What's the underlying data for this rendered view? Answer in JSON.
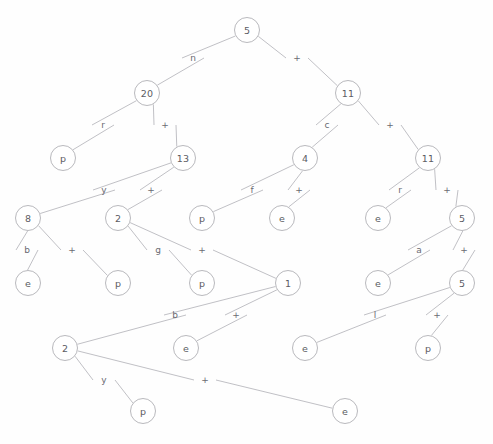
{
  "diagram": {
    "node_stroke": "#b9b9bd",
    "edge_stroke": "#b0b0b6",
    "text_color": "#5c5c63",
    "background": "#fefefe",
    "nodes": [
      {
        "id": "n0",
        "label": "5",
        "x": 247,
        "y": 30
      },
      {
        "id": "n1",
        "label": "20",
        "x": 147,
        "y": 93
      },
      {
        "id": "n2",
        "label": "11",
        "x": 348,
        "y": 93
      },
      {
        "id": "n3",
        "label": "p",
        "x": 63,
        "y": 158
      },
      {
        "id": "n4",
        "label": "13",
        "x": 183,
        "y": 158
      },
      {
        "id": "n5",
        "label": "4",
        "x": 305,
        "y": 158
      },
      {
        "id": "n6",
        "label": "11",
        "x": 428,
        "y": 158
      },
      {
        "id": "n7",
        "label": "8",
        "x": 28,
        "y": 218
      },
      {
        "id": "n8",
        "label": "2",
        "x": 118,
        "y": 218
      },
      {
        "id": "n9",
        "label": "p",
        "x": 202,
        "y": 218
      },
      {
        "id": "n10",
        "label": "e",
        "x": 282,
        "y": 218
      },
      {
        "id": "n11",
        "label": "e",
        "x": 378,
        "y": 218
      },
      {
        "id": "n12",
        "label": "5",
        "x": 462,
        "y": 218
      },
      {
        "id": "n13",
        "label": "e",
        "x": 28,
        "y": 283
      },
      {
        "id": "n14",
        "label": "p",
        "x": 118,
        "y": 283
      },
      {
        "id": "n15",
        "label": "p",
        "x": 202,
        "y": 283
      },
      {
        "id": "n16",
        "label": "1",
        "x": 288,
        "y": 283
      },
      {
        "id": "n17",
        "label": "e",
        "x": 378,
        "y": 283
      },
      {
        "id": "n18",
        "label": "5",
        "x": 462,
        "y": 283
      },
      {
        "id": "n19",
        "label": "2",
        "x": 65,
        "y": 348
      },
      {
        "id": "n20",
        "label": "e",
        "x": 186,
        "y": 348
      },
      {
        "id": "n21",
        "label": "e",
        "x": 305,
        "y": 348
      },
      {
        "id": "n22",
        "label": "p",
        "x": 428,
        "y": 348
      },
      {
        "id": "n23",
        "label": "p",
        "x": 143,
        "y": 411
      },
      {
        "id": "n24",
        "label": "e",
        "x": 345,
        "y": 411
      }
    ],
    "edges": [
      {
        "from": "n0",
        "to": "n1",
        "label": "n",
        "lx": 193,
        "ly": 58
      },
      {
        "from": "n0",
        "to": "n2",
        "label": "+",
        "lx": 297,
        "ly": 58
      },
      {
        "from": "n1",
        "to": "n3",
        "label": "r",
        "lx": 103,
        "ly": 125
      },
      {
        "from": "n1",
        "to": "n4",
        "label": "+",
        "lx": 165,
        "ly": 125
      },
      {
        "from": "n2",
        "to": "n5",
        "label": "c",
        "lx": 327,
        "ly": 125
      },
      {
        "from": "n2",
        "to": "n6",
        "label": "+",
        "lx": 390,
        "ly": 125
      },
      {
        "from": "n4",
        "to": "n7",
        "label": "y",
        "lx": 104,
        "ly": 190
      },
      {
        "from": "n4",
        "to": "n8",
        "label": "+",
        "lx": 151,
        "ly": 190
      },
      {
        "from": "n5",
        "to": "n9",
        "label": "f",
        "lx": 252,
        "ly": 190
      },
      {
        "from": "n5",
        "to": "n10",
        "label": "+",
        "lx": 299,
        "ly": 190
      },
      {
        "from": "n6",
        "to": "n11",
        "label": "r",
        "lx": 400,
        "ly": 190
      },
      {
        "from": "n6",
        "to": "n12",
        "label": "+",
        "lx": 447,
        "ly": 190
      },
      {
        "from": "n7",
        "to": "n13",
        "label": "b",
        "lx": 27,
        "ly": 250
      },
      {
        "from": "n7",
        "to": "n14",
        "label": "+",
        "lx": 72,
        "ly": 250
      },
      {
        "from": "n8",
        "to": "n15",
        "label": "g",
        "lx": 158,
        "ly": 250
      },
      {
        "from": "n8",
        "to": "n16",
        "label": "+",
        "lx": 202,
        "ly": 250
      },
      {
        "from": "n12",
        "to": "n17",
        "label": "a",
        "lx": 419,
        "ly": 250
      },
      {
        "from": "n12",
        "to": "n18",
        "label": "+",
        "lx": 464,
        "ly": 250
      },
      {
        "from": "n16",
        "to": "n19",
        "label": "b",
        "lx": 175,
        "ly": 315
      },
      {
        "from": "n16",
        "to": "n20",
        "label": "+",
        "lx": 236,
        "ly": 315
      },
      {
        "from": "n18",
        "to": "n21",
        "label": "l",
        "lx": 375,
        "ly": 315
      },
      {
        "from": "n18",
        "to": "n22",
        "label": "+",
        "lx": 437,
        "ly": 315
      },
      {
        "from": "n19",
        "to": "n23",
        "label": "y",
        "lx": 104,
        "ly": 380
      },
      {
        "from": "n19",
        "to": "n24",
        "label": "+",
        "lx": 205,
        "ly": 380
      }
    ]
  }
}
